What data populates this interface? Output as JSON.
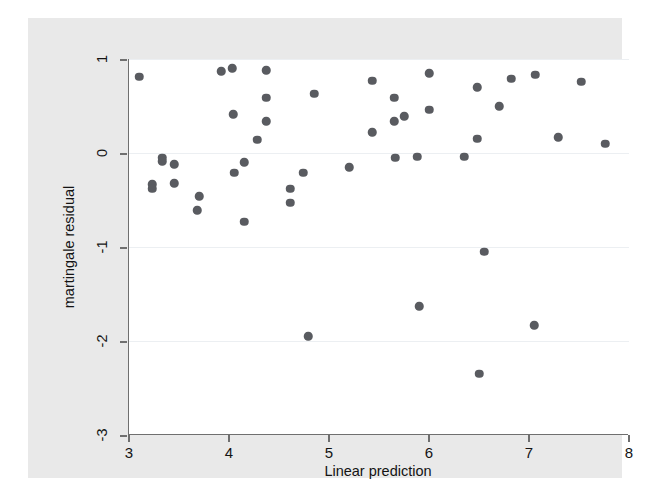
{
  "chart": {
    "type": "scatter",
    "title": "",
    "xlabel": "Linear prediction",
    "ylabel": "martingale residual",
    "xlim": [
      3,
      8
    ],
    "ylim": [
      -3,
      1
    ],
    "xticks": [
      3,
      4,
      5,
      6,
      7,
      8
    ],
    "xtick_labels": [
      "3",
      "4",
      "5",
      "6",
      "7",
      "8"
    ],
    "yticks": [
      1,
      0,
      -1,
      -2,
      -3
    ],
    "ytick_labels": [
      "1",
      "0",
      "-1",
      "-2",
      "-3"
    ],
    "grid": "horizontal",
    "legend": null,
    "marker_color": "#595b60",
    "panel_color": "#ffffff",
    "figure_color": "#e9e9e9",
    "axis_color": "#6f6f6f",
    "gridline_color": "#eceff2",
    "n_points": 47
  },
  "chart_data": {
    "type": "scatter",
    "title": "",
    "xlabel": "Linear prediction",
    "ylabel": "martingale residual",
    "xlim": [
      3,
      8
    ],
    "ylim": [
      -3,
      1
    ],
    "grid": true,
    "legend_position": "none",
    "series": [
      {
        "name": "martingale residual",
        "color": "#595b60",
        "points": [
          [
            3.1,
            0.81
          ],
          [
            3.23,
            -0.33
          ],
          [
            3.23,
            -0.38
          ],
          [
            3.33,
            -0.05
          ],
          [
            3.33,
            -0.09
          ],
          [
            3.45,
            -0.12
          ],
          [
            3.45,
            -0.32
          ],
          [
            3.7,
            -0.46
          ],
          [
            3.68,
            -0.61
          ],
          [
            3.92,
            0.87
          ],
          [
            4.03,
            0.9
          ],
          [
            4.04,
            0.41
          ],
          [
            4.05,
            -0.21
          ],
          [
            4.15,
            -0.1
          ],
          [
            4.15,
            -0.73
          ],
          [
            4.28,
            0.14
          ],
          [
            4.37,
            0.88
          ],
          [
            4.37,
            0.59
          ],
          [
            4.37,
            0.34
          ],
          [
            4.61,
            -0.38
          ],
          [
            4.61,
            -0.53
          ],
          [
            4.74,
            -0.21
          ],
          [
            4.79,
            -1.95
          ],
          [
            4.85,
            0.63
          ],
          [
            5.2,
            -0.15
          ],
          [
            5.43,
            0.77
          ],
          [
            5.43,
            0.22
          ],
          [
            5.65,
            0.59
          ],
          [
            5.65,
            0.34
          ],
          [
            5.66,
            -0.05
          ],
          [
            5.75,
            0.39
          ],
          [
            5.88,
            -0.04
          ],
          [
            5.9,
            -1.63
          ],
          [
            6.0,
            0.85
          ],
          [
            6.0,
            0.46
          ],
          [
            6.35,
            -0.04
          ],
          [
            6.48,
            0.7
          ],
          [
            6.48,
            0.15
          ],
          [
            6.55,
            -1.05
          ],
          [
            6.5,
            -2.35
          ],
          [
            6.7,
            0.5
          ],
          [
            6.82,
            0.79
          ],
          [
            7.06,
            0.83
          ],
          [
            7.05,
            -1.83
          ],
          [
            7.29,
            0.17
          ],
          [
            7.52,
            0.76
          ],
          [
            7.76,
            0.1
          ]
        ]
      }
    ]
  }
}
